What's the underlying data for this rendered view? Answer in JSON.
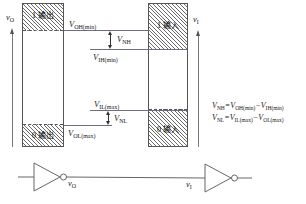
{
  "diagram": {
    "output_column": {
      "high_band_label": "1 输出",
      "low_band_label": "0 输出",
      "axis_label": "v",
      "axis_label_sub": "O"
    },
    "input_column": {
      "high_band_label": "1 输入",
      "low_band_label": "0 输入",
      "axis_label": "v",
      "axis_label_sub": "I"
    },
    "levels": [
      {
        "name": "voh-min",
        "label": "V",
        "sub": "OH(min)"
      },
      {
        "name": "vih-min",
        "label": "V",
        "sub": "IH(min)"
      },
      {
        "name": "vil-max",
        "label": "V",
        "sub": "IL(max)"
      },
      {
        "name": "vol-max",
        "label": "V",
        "sub": "OL(max)"
      }
    ],
    "margins": [
      {
        "name": "vnh",
        "label": "V",
        "sub": "NH"
      },
      {
        "name": "vnl",
        "label": "V",
        "sub": "NL"
      }
    ],
    "equations": [
      {
        "lhs": "V",
        "lhs_sub": "NH",
        "eq": "=",
        "t1": "V",
        "t1_sub": "OH(min)",
        "op": "−",
        "t2": "V",
        "t2_sub": "IH(min)"
      },
      {
        "lhs": "V",
        "lhs_sub": "NL",
        "eq": "=",
        "t1": "V",
        "t1_sub": "IL(max)",
        "op": "−",
        "t2": "V",
        "t2_sub": "OL(max)"
      }
    ]
  },
  "circuit": {
    "driver_gate": "inverter",
    "load_gate": "inverter",
    "output_signal": "v",
    "output_signal_sub": "O",
    "input_signal": "v",
    "input_signal_sub": "I"
  },
  "colors": {
    "line": "#555555",
    "hatch": "#6a6a6a",
    "level": "#6e6e80",
    "text": "#000000"
  }
}
